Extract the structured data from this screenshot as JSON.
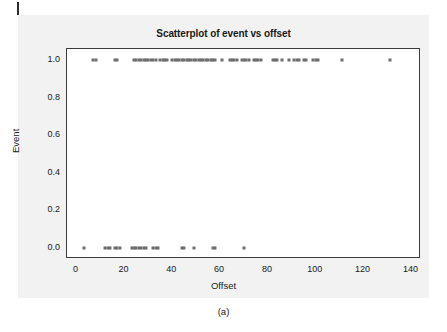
{
  "figure": {
    "caption": "(a)",
    "background_color": "#f2f2f2",
    "point_color": "#6e6e6e",
    "axis_color": "#3c3c3c"
  },
  "chart_data": {
    "type": "scatter",
    "title": "Scatterplot of event vs offset",
    "xlabel": "Offset",
    "ylabel": "Event",
    "xlim": [
      -4,
      144
    ],
    "ylim": [
      -0.06,
      1.06
    ],
    "grid": false,
    "legend": null,
    "xticks": [
      0,
      20,
      40,
      60,
      80,
      100,
      120,
      140
    ],
    "xtick_labels": [
      "0",
      "20",
      "40",
      "60",
      "80",
      "100",
      "120",
      "140"
    ],
    "yticks": [
      0.0,
      0.2,
      0.4,
      0.6,
      0.8,
      1.0
    ],
    "ytick_labels": [
      "0.0",
      "0.2",
      "0.4",
      "0.6",
      "0.8",
      "1.0"
    ],
    "series": [
      {
        "name": "Event = 1",
        "y": 1.0,
        "x": [
          7,
          8,
          16,
          17,
          24,
          25,
          26,
          27,
          28,
          29,
          30,
          31,
          32,
          33,
          35,
          36,
          37,
          38,
          40,
          41,
          42,
          43,
          44,
          45,
          46,
          47,
          48,
          49,
          50,
          51,
          52,
          53,
          54,
          55,
          56,
          57,
          58,
          61,
          64,
          65,
          66,
          67,
          69,
          70,
          71,
          72,
          74,
          75,
          76,
          77,
          82,
          83,
          84,
          86,
          89,
          91,
          92,
          93,
          95,
          96,
          99,
          100,
          101,
          111,
          131
        ]
      },
      {
        "name": "Event = 0",
        "y": 0.0,
        "x": [
          3,
          12,
          13,
          14,
          16,
          17,
          18,
          23,
          24,
          25,
          26,
          27,
          28,
          29,
          32,
          33,
          34,
          44,
          45,
          49,
          57,
          58,
          70
        ]
      }
    ]
  }
}
